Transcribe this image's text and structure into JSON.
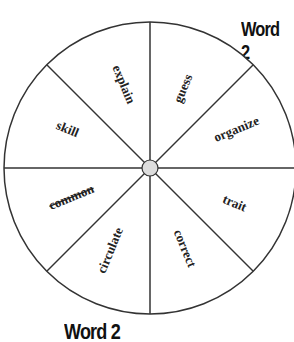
{
  "title_top": "Word 2",
  "title_bottom": "Word 2",
  "wheel": {
    "center": [
      150,
      168
    ],
    "radius": 146,
    "segments": 8,
    "hub_color": "#dddddd",
    "line_color": "#333333",
    "words": [
      {
        "text": "explain",
        "struck": false
      },
      {
        "text": "guess",
        "struck": false
      },
      {
        "text": "organize",
        "struck": false
      },
      {
        "text": "trait",
        "struck": false
      },
      {
        "text": "correct",
        "struck": false
      },
      {
        "text": "circulate",
        "struck": false
      },
      {
        "text": "common",
        "struck": true
      },
      {
        "text": "skill",
        "struck": false
      }
    ]
  }
}
